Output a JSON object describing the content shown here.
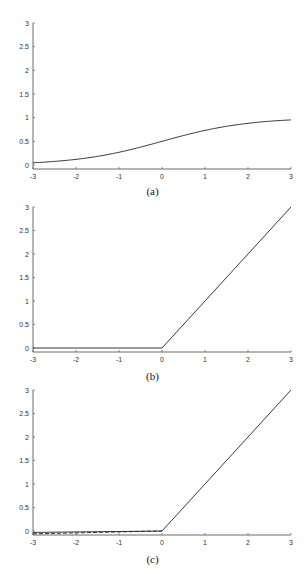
{
  "chart_data": [
    {
      "type": "line",
      "caption": "(a)",
      "title": "",
      "xlabel": "",
      "ylabel": "",
      "xlim": [
        -3,
        3
      ],
      "ylim": [
        0,
        3
      ],
      "xticks": [
        "-3",
        "-2",
        "-1",
        "0",
        "1",
        "2",
        "3"
      ],
      "yticks": [
        "0",
        "0.5",
        "1",
        "1.5",
        "2",
        "2.5",
        "3"
      ],
      "grid": false,
      "legend": null,
      "series": [
        {
          "name": "sigmoid",
          "style": "solid",
          "x": [
            -3,
            -2.5,
            -2,
            -1.5,
            -1,
            -0.5,
            0,
            0.5,
            1,
            1.5,
            2,
            2.5,
            3
          ],
          "y": [
            0.047,
            0.076,
            0.119,
            0.182,
            0.269,
            0.378,
            0.5,
            0.622,
            0.731,
            0.818,
            0.881,
            0.924,
            0.953
          ]
        }
      ]
    },
    {
      "type": "line",
      "caption": "(b)",
      "title": "",
      "xlabel": "",
      "ylabel": "",
      "xlim": [
        -3,
        3
      ],
      "ylim": [
        0,
        3
      ],
      "xticks": [
        "-3",
        "-2",
        "-1",
        "0",
        "1",
        "2",
        "3"
      ],
      "yticks": [
        "0",
        "0.5",
        "1",
        "1.5",
        "2",
        "2.5",
        "3"
      ],
      "grid": false,
      "legend": null,
      "series": [
        {
          "name": "relu",
          "style": "solid",
          "x": [
            -3,
            0,
            3
          ],
          "y": [
            0,
            0,
            3
          ]
        }
      ]
    },
    {
      "type": "line",
      "caption": "(c)",
      "title": "",
      "xlabel": "",
      "ylabel": "",
      "xlim": [
        -3,
        3
      ],
      "ylim": [
        0,
        3
      ],
      "xticks": [
        "-3",
        "-2",
        "-1",
        "0",
        "1",
        "2",
        "3"
      ],
      "yticks": [
        "0",
        "0.5",
        "1",
        "1.5",
        "2",
        "2.5",
        "3"
      ],
      "grid": false,
      "legend": null,
      "series": [
        {
          "name": "leaky-relu",
          "style": "solid",
          "x": [
            -3,
            0,
            3
          ],
          "y": [
            -0.03,
            0,
            3
          ]
        },
        {
          "name": "leaky-relu-alt",
          "style": "dashed",
          "x": [
            -3,
            0
          ],
          "y": [
            -0.06,
            0
          ]
        }
      ]
    }
  ],
  "captions": {
    "a": "(a)",
    "b": "(b)",
    "c": "(c)"
  }
}
